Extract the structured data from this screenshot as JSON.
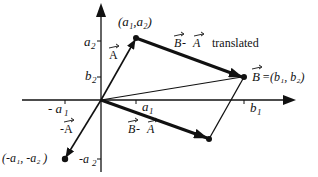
{
  "diagram": {
    "points": {
      "origin": {
        "x": 101,
        "y": 100
      },
      "A": {
        "x": 136,
        "y": 38,
        "label": "(a₁,a₂)"
      },
      "B": {
        "x": 244,
        "y": 77,
        "label": "=(b₁, b₂)"
      },
      "negA": {
        "x": 65,
        "y": 159,
        "label": "(-a₁, -a₂ )"
      },
      "BminusA": {
        "x": 209,
        "y": 139
      }
    },
    "labels": {
      "vecA": "A",
      "vecNegA": "-A",
      "vecB": "B",
      "translated_B": "B",
      "translated_dash": " - ",
      "translated_A": "A",
      "translated_word": "translated",
      "diff_B": "B",
      "diff_dash": " - ",
      "diff_A": "A"
    },
    "axis_ticks": {
      "a2": "a",
      "a2_sub": "2",
      "b2": "b",
      "b2_sub": "2",
      "neg_a1": "- a",
      "neg_a1_sub": "1",
      "a1": "a",
      "a1_sub": "1",
      "b1": "b",
      "b1_sub": "1",
      "neg_a2": "-a",
      "neg_a2_sub": "2"
    }
  }
}
